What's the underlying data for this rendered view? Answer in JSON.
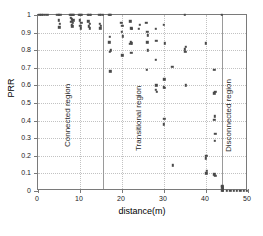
{
  "chart_data": {
    "type": "scatter",
    "title": "",
    "xlabel": "distance(m)",
    "ylabel": "PRR",
    "xlim": [
      0,
      50
    ],
    "ylim": [
      0,
      1
    ],
    "grid": true,
    "legend": null,
    "xticks": [
      "0",
      "10",
      "20",
      "30",
      "40",
      "50"
    ],
    "xtick_values": [
      0,
      10,
      20,
      30,
      40,
      50
    ],
    "yticks": [
      "0",
      "0.1",
      "0.2",
      "0.3",
      "0.4",
      "0.5",
      "0.6",
      "0.7",
      "0.8",
      "0.9",
      "1"
    ],
    "ytick_values": [
      0,
      0.1,
      0.2,
      0.3,
      0.4,
      0.5,
      0.6,
      0.7,
      0.8,
      0.9,
      1.0
    ],
    "annotations": [
      {
        "text": "Connected region",
        "x": 8.0,
        "y": 0.3,
        "rotation": -90
      },
      {
        "text": "Transitional region",
        "x": 25.0,
        "y": 0.28,
        "rotation": -90
      },
      {
        "text": "Disconnected region",
        "x": 46.5,
        "y": 0.27,
        "rotation": -90
      }
    ],
    "region_dividers": [
      15.5,
      43.7
    ],
    "marker": "dot",
    "marker_color": "#4a4a4a",
    "points": [
      [
        0.3,
        1.0
      ],
      [
        0.8,
        1.0
      ],
      [
        1.2,
        1.0
      ],
      [
        1.6,
        1.0
      ],
      [
        2.2,
        1.0
      ],
      [
        4.6,
        1.0
      ],
      [
        5.0,
        1.0
      ],
      [
        5.3,
        1.0
      ],
      [
        5.0,
        0.97
      ],
      [
        5.2,
        0.95
      ],
      [
        5.1,
        0.93
      ],
      [
        7.6,
        1.0
      ],
      [
        7.9,
        1.0
      ],
      [
        8.2,
        1.0
      ],
      [
        8.5,
        1.0
      ],
      [
        7.8,
        0.985
      ],
      [
        8.1,
        0.975
      ],
      [
        8.4,
        0.97
      ],
      [
        7.9,
        0.96
      ],
      [
        8.3,
        0.955
      ],
      [
        8.0,
        0.945
      ],
      [
        8.2,
        0.935
      ],
      [
        9.8,
        1.0
      ],
      [
        10.1,
        1.0
      ],
      [
        10.4,
        1.0
      ],
      [
        10.0,
        0.97
      ],
      [
        10.3,
        0.955
      ],
      [
        10.1,
        0.94
      ],
      [
        10.2,
        0.925
      ],
      [
        11.9,
        1.0
      ],
      [
        12.2,
        1.0
      ],
      [
        12.5,
        1.0
      ],
      [
        12.0,
        0.965
      ],
      [
        12.3,
        0.95
      ],
      [
        12.1,
        0.935
      ],
      [
        12.4,
        0.925
      ],
      [
        14.6,
        1.0
      ],
      [
        14.9,
        1.0
      ],
      [
        14.7,
        0.95
      ],
      [
        14.9,
        0.94
      ],
      [
        14.8,
        0.925
      ],
      [
        15.5,
        1.0
      ],
      [
        17.0,
        1.0
      ],
      [
        17.2,
        1.0
      ],
      [
        17.1,
        0.875
      ],
      [
        17.0,
        0.845
      ],
      [
        17.3,
        0.8
      ],
      [
        17.1,
        0.79
      ],
      [
        17.2,
        0.68
      ],
      [
        19.8,
        0.955
      ],
      [
        20.1,
        0.94
      ],
      [
        20.0,
        0.905
      ],
      [
        20.2,
        0.88
      ],
      [
        20.1,
        0.77
      ],
      [
        22.0,
        0.965
      ],
      [
        22.2,
        0.925
      ],
      [
        22.4,
        0.92
      ],
      [
        22.1,
        0.845
      ],
      [
        22.3,
        0.84
      ],
      [
        22.0,
        0.835
      ],
      [
        22.2,
        0.785
      ],
      [
        24.2,
        0.945
      ],
      [
        24.0,
        0.92
      ],
      [
        25.8,
        0.955
      ],
      [
        26.0,
        0.905
      ],
      [
        26.2,
        0.885
      ],
      [
        26.0,
        0.845
      ],
      [
        26.1,
        0.8
      ],
      [
        25.9,
        0.69
      ],
      [
        28.0,
        0.92
      ],
      [
        28.2,
        0.855
      ],
      [
        28.0,
        0.745
      ],
      [
        28.2,
        0.6
      ],
      [
        28.1,
        0.575
      ],
      [
        28.3,
        0.565
      ],
      [
        30.0,
        0.945
      ],
      [
        30.2,
        0.84
      ],
      [
        30.1,
        0.635
      ],
      [
        30.0,
        0.59
      ],
      [
        30.2,
        0.585
      ],
      [
        30.1,
        0.41
      ],
      [
        30.0,
        0.38
      ],
      [
        32.0,
        0.705
      ],
      [
        32.1,
        0.145
      ],
      [
        35.0,
        1.0
      ],
      [
        35.2,
        0.82
      ],
      [
        35.0,
        0.805
      ],
      [
        35.1,
        0.79
      ],
      [
        35.2,
        0.6
      ],
      [
        40.0,
        0.84
      ],
      [
        40.1,
        0.2
      ],
      [
        40.0,
        0.185
      ],
      [
        40.2,
        0.115
      ],
      [
        40.1,
        0.1
      ],
      [
        42.0,
        0.69
      ],
      [
        42.2,
        0.565
      ],
      [
        42.0,
        0.555
      ],
      [
        42.1,
        0.425
      ],
      [
        42.0,
        0.405
      ],
      [
        42.2,
        0.325
      ],
      [
        42.1,
        0.285
      ],
      [
        42.0,
        0.095
      ],
      [
        42.2,
        0.085
      ],
      [
        43.7,
        1.0
      ],
      [
        43.9,
        0.03
      ],
      [
        43.9,
        0.02
      ],
      [
        44.0,
        0.015
      ],
      [
        44.0,
        0.01
      ],
      [
        43.9,
        0.005
      ],
      [
        44.0,
        0.0
      ],
      [
        45.0,
        0.0
      ],
      [
        45.8,
        0.0
      ],
      [
        46.6,
        0.0
      ],
      [
        47.4,
        0.0
      ],
      [
        48.2,
        0.0
      ],
      [
        49.0,
        0.0
      ],
      [
        49.7,
        0.0
      ]
    ]
  }
}
